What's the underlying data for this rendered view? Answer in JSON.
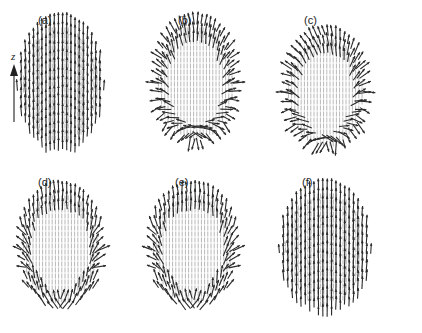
{
  "figure": {
    "axis": {
      "label": "z",
      "direction": "up"
    },
    "colors": {
      "arrow_dark": "#2a2a2a",
      "arrow_light": "#b8b8b8",
      "background": "#ffffff"
    },
    "panels": [
      {
        "id": "a",
        "label": "(a)",
        "x": 60,
        "y": 10,
        "w": 95,
        "h": 150,
        "mode": "vertical",
        "label_x": 38,
        "label_y": 26
      },
      {
        "id": "b",
        "label": "(b)",
        "x": 195,
        "y": 10,
        "w": 95,
        "h": 145,
        "mode": "radial",
        "label_x": 178,
        "label_y": 26
      },
      {
        "id": "c",
        "label": "(c)",
        "x": 325,
        "y": 22,
        "w": 95,
        "h": 140,
        "mode": "radial-twist",
        "label_x": 304,
        "label_y": 26
      },
      {
        "id": "d",
        "label": "(d)",
        "x": 60,
        "y": 178,
        "w": 95,
        "h": 140,
        "mode": "hedgehog-mid",
        "label_x": 38,
        "label_y": 188
      },
      {
        "id": "e",
        "label": "(e)",
        "x": 193,
        "y": 178,
        "w": 100,
        "h": 140,
        "mode": "hedgehog-mid",
        "label_x": 175,
        "label_y": 188
      },
      {
        "id": "f",
        "label": "(f)",
        "x": 325,
        "y": 176,
        "w": 100,
        "h": 145,
        "mode": "vertical",
        "label_x": 302,
        "label_y": 188
      }
    ]
  }
}
